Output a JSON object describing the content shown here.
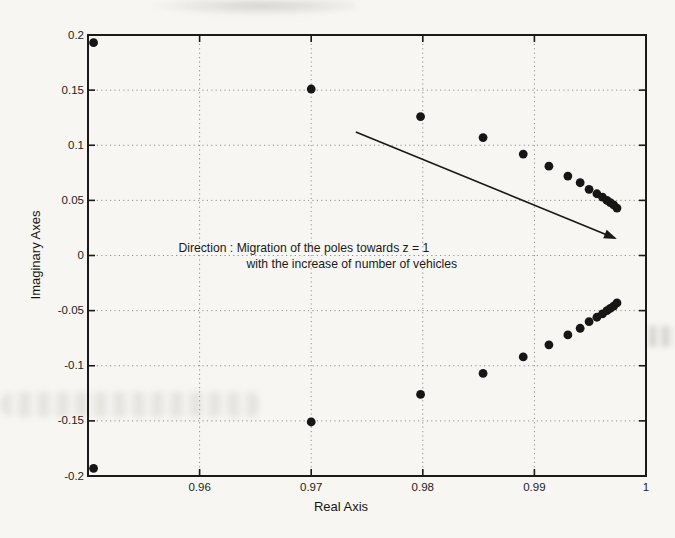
{
  "figure": {
    "background_color": "#f7f6f2",
    "ink_color": "#1a1a1a",
    "grid_color": "#8f8f8f",
    "marker_color": "#161616"
  },
  "chart_data": {
    "type": "scatter",
    "title": "",
    "xlabel": "Real Axis",
    "ylabel": "Imaginary Axes",
    "xlim": [
      0.95,
      1.0
    ],
    "ylim": [
      -0.2,
      0.2
    ],
    "xticks": [
      0.96,
      0.97,
      0.98,
      0.99,
      1.0
    ],
    "xtick_labels": [
      "0.96",
      "0.97",
      "0.98",
      "0.99",
      "1"
    ],
    "yticks": [
      0.2,
      0.15,
      0.1,
      0.05,
      0,
      -0.05,
      -0.1,
      -0.15,
      -0.2
    ],
    "ytick_labels": [
      "0.2",
      "0.15",
      "0.1",
      "0.05",
      "0",
      "-0.05",
      "-0.1",
      "-0.15",
      "-0.2"
    ],
    "grid": true,
    "legend": null,
    "marker": {
      "shape": "circle",
      "radius_px": 4.4
    },
    "series": [
      {
        "name": "upper-branch poles",
        "points": [
          [
            0.9505,
            0.193
          ],
          [
            0.97,
            0.151
          ],
          [
            0.9798,
            0.126
          ],
          [
            0.9854,
            0.107
          ],
          [
            0.989,
            0.092
          ],
          [
            0.9913,
            0.081
          ],
          [
            0.993,
            0.072
          ],
          [
            0.9941,
            0.066
          ],
          [
            0.9949,
            0.06
          ],
          [
            0.9956,
            0.056
          ],
          [
            0.9961,
            0.053
          ],
          [
            0.9965,
            0.05
          ],
          [
            0.9968,
            0.048
          ],
          [
            0.9971,
            0.046
          ],
          [
            0.9974,
            0.043
          ]
        ]
      },
      {
        "name": "lower-branch poles",
        "points": [
          [
            0.9505,
            -0.193
          ],
          [
            0.97,
            -0.151
          ],
          [
            0.9798,
            -0.126
          ],
          [
            0.9854,
            -0.107
          ],
          [
            0.989,
            -0.092
          ],
          [
            0.9913,
            -0.081
          ],
          [
            0.993,
            -0.072
          ],
          [
            0.9941,
            -0.066
          ],
          [
            0.9949,
            -0.06
          ],
          [
            0.9956,
            -0.056
          ],
          [
            0.9961,
            -0.053
          ],
          [
            0.9965,
            -0.05
          ],
          [
            0.9968,
            -0.048
          ],
          [
            0.9971,
            -0.046
          ],
          [
            0.9974,
            -0.043
          ]
        ]
      }
    ],
    "arrow": {
      "from": [
        0.974,
        0.112
      ],
      "to": [
        0.9974,
        0.015
      ]
    },
    "annotations": [
      {
        "x": 0.9581,
        "y": 0.006,
        "text": "Direction : Migration of the poles towards z = 1"
      },
      {
        "x": 0.9642,
        "y": -0.0086,
        "text": "with the increase of number of vehicles"
      }
    ]
  }
}
